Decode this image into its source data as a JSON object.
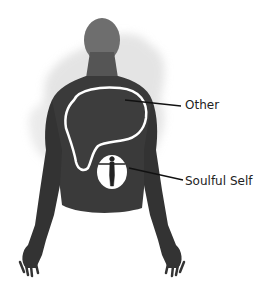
{
  "diagram": {
    "type": "labeled-illustration",
    "labels": {
      "other": "Other",
      "soulful_self": "Soulful Self"
    },
    "colors": {
      "body": "#3a3a3a",
      "head": "#6a6a6a",
      "watercolor_wash": "#d8d8d8",
      "outline": "#ffffff",
      "leader_line": "#111111",
      "text": "#222222",
      "background": "#ffffff"
    }
  }
}
